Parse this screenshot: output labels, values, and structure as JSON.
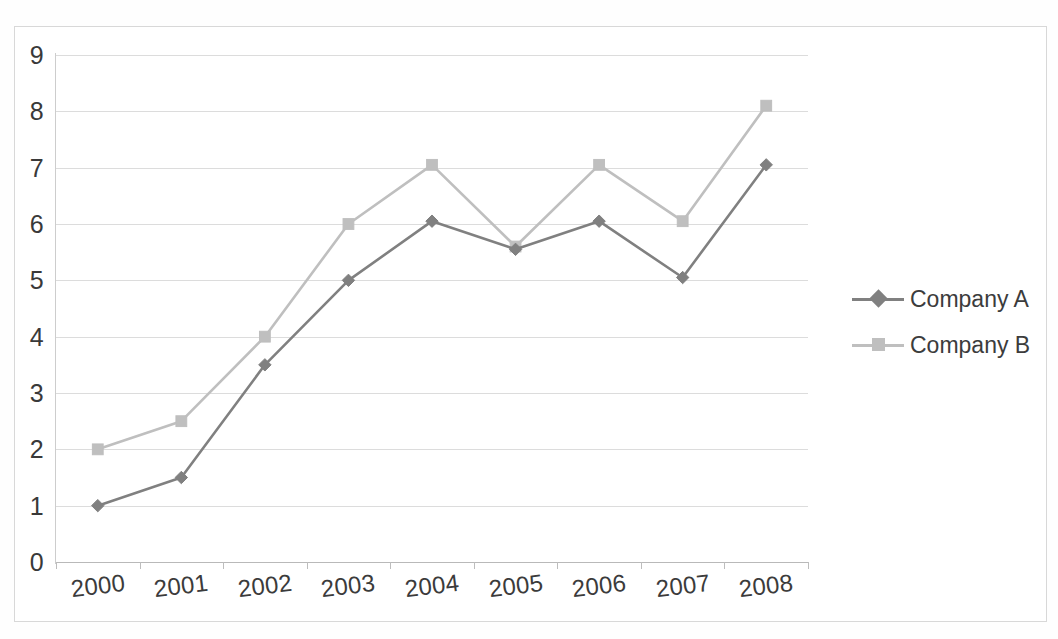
{
  "chart_data": {
    "type": "line",
    "title": "",
    "subtitle": "",
    "xlabel": "",
    "ylabel": "",
    "categories": [
      "2000",
      "2001",
      "2002",
      "2003",
      "2004",
      "2005",
      "2006",
      "2007",
      "2008"
    ],
    "series": [
      {
        "name": "Company A",
        "color": "#808080",
        "marker": "diamond",
        "values": [
          1.0,
          1.5,
          3.5,
          5.0,
          6.05,
          5.55,
          6.05,
          5.05,
          7.05
        ]
      },
      {
        "name": "Company B",
        "color": "#bfbfbf",
        "marker": "square",
        "values": [
          2.0,
          2.5,
          4.0,
          6.0,
          7.05,
          5.6,
          7.05,
          6.05,
          8.1
        ]
      }
    ],
    "ylim": [
      0,
      9
    ],
    "y_ticks": [
      0,
      1,
      2,
      3,
      4,
      5,
      6,
      7,
      8,
      9
    ],
    "y_tick_labels": [
      "0",
      "1",
      "2",
      "3",
      "4",
      "5",
      "6",
      "7",
      "8",
      "9"
    ],
    "grid": true,
    "grid_axis": "y",
    "legend_position": "right",
    "legend_entries": [
      "Company A",
      "Company B"
    ]
  },
  "axes": {
    "y_labels": [
      "9",
      "8",
      "7",
      "6",
      "5",
      "4",
      "3",
      "2",
      "1",
      "0"
    ],
    "x_labels": [
      "2000",
      "2001",
      "2002",
      "2003",
      "2004",
      "2005",
      "2006",
      "2007",
      "2008"
    ]
  },
  "legend": {
    "items": [
      {
        "label": "Company A",
        "color": "#808080",
        "marker": "diamond"
      },
      {
        "label": "Company B",
        "color": "#bfbfbf",
        "marker": "square"
      }
    ]
  },
  "colors": {
    "series_a": "#808080",
    "series_b": "#bfbfbf",
    "gridline": "#dcdcdc",
    "axis": "#b9b9b9",
    "text": "#3a3a3a",
    "frame": "#d8d8d8",
    "background": "#ffffff"
  }
}
